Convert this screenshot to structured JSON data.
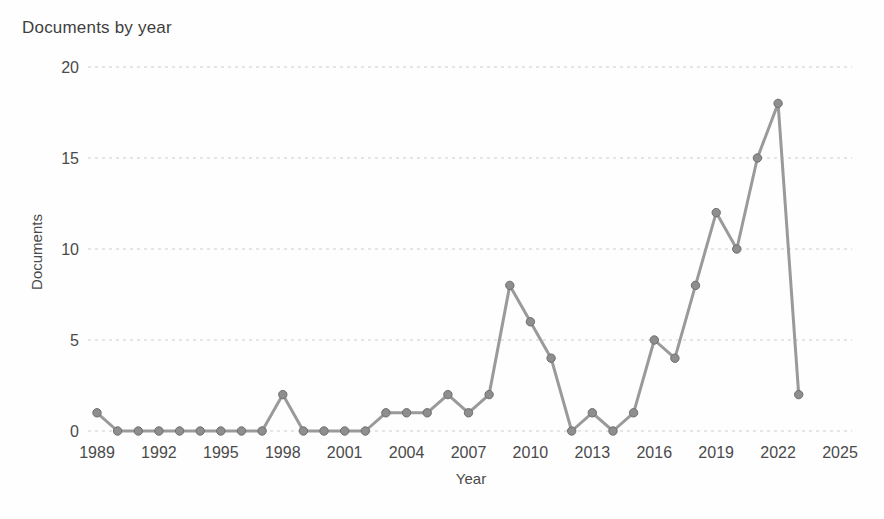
{
  "chart_data": {
    "type": "line",
    "title": "Documents by year",
    "xlabel": "Year",
    "ylabel": "Documents",
    "x": [
      1989,
      1990,
      1991,
      1992,
      1993,
      1994,
      1995,
      1996,
      1997,
      1998,
      1999,
      2000,
      2001,
      2002,
      2003,
      2004,
      2005,
      2006,
      2007,
      2008,
      2009,
      2010,
      2011,
      2012,
      2013,
      2014,
      2015,
      2016,
      2017,
      2018,
      2019,
      2020,
      2021,
      2022,
      2023
    ],
    "values": [
      1,
      0,
      0,
      0,
      0,
      0,
      0,
      0,
      0,
      2,
      0,
      0,
      0,
      0,
      1,
      1,
      1,
      2,
      1,
      2,
      8,
      6,
      4,
      0,
      1,
      0,
      1,
      5,
      4,
      8,
      12,
      10,
      15,
      18,
      2
    ],
    "xticks": [
      1989,
      1992,
      1995,
      1998,
      2001,
      2004,
      2007,
      2010,
      2013,
      2016,
      2019,
      2022,
      2025
    ],
    "yticks": [
      0,
      5,
      10,
      15,
      20
    ],
    "xlim": [
      1989,
      2025
    ],
    "ylim": [
      0,
      20
    ],
    "grid": "horizontal-dashed",
    "legend": "none",
    "series_name": "Documents",
    "colors": {
      "line": "#9a9a9a",
      "marker_fill": "#8e8e8e",
      "marker_stroke": "#6e6e6e",
      "grid": "#cbcbcb",
      "text": "#4a4a4a",
      "title_text": "#3e3e3e"
    }
  }
}
